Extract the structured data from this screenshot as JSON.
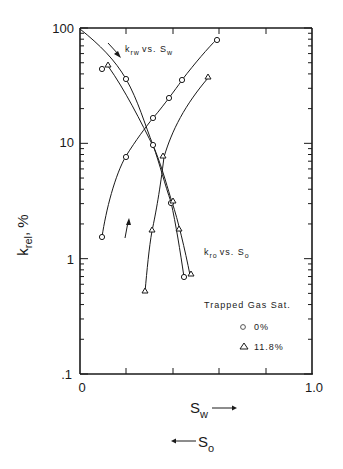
{
  "chart_data": {
    "type": "line",
    "title": "",
    "xlabel": "S_w (→), S_o (←)",
    "ylabel": "k_rel, %",
    "xlim": [
      0,
      1.0
    ],
    "ylim": [
      0.1,
      100
    ],
    "yscale": "log",
    "x_tick_labels": [
      "0",
      "1.0"
    ],
    "y_tick_labels": [
      "100",
      "10",
      "1",
      ".1"
    ],
    "grid": false,
    "annotations": [
      "k_rw vs. S_w",
      "k_ro vs. S_o"
    ],
    "legend": {
      "title": "Trapped Gas Sat.",
      "entries": [
        {
          "marker": "circle",
          "label": "0%"
        },
        {
          "marker": "triangle",
          "label": "11.8%"
        }
      ],
      "position": "lower right"
    },
    "series": [
      {
        "name": "k_rw, 0% trapped gas",
        "marker": "circle",
        "x": [
          0.09,
          0.2,
          0.32,
          0.39,
          0.44,
          0.59
        ],
        "y": [
          1.5,
          7.5,
          16,
          24,
          35,
          80
        ]
      },
      {
        "name": "k_rw, 11.8% trapped gas",
        "marker": "triangle",
        "x": [
          0.28,
          0.31,
          0.36,
          0.55
        ],
        "y": [
          0.5,
          1.7,
          7.5,
          36
        ]
      },
      {
        "name": "k_ro, 0% trapped gas",
        "marker": "circle",
        "x": [
          0.09,
          0.2,
          0.31,
          0.39,
          0.45
        ],
        "y": [
          45,
          35,
          9.5,
          3.0,
          0.7
        ]
      },
      {
        "name": "k_ro, 11.8% trapped gas",
        "marker": "triangle",
        "x": [
          0.11,
          0.39,
          0.42,
          0.48
        ],
        "y": [
          48,
          3.0,
          1.7,
          0.72
        ]
      }
    ]
  },
  "labels": {
    "y100": "100",
    "y10": "10",
    "y1": "1",
    "y01": ".1",
    "x0": "0",
    "x1": "1.0",
    "krw_k": "k",
    "krw_sub": "rw",
    "krw_vs": "vs. S",
    "krw_sub2": "w",
    "kro_k": "k",
    "kro_sub": "ro",
    "kro_vs": "vs. S",
    "kro_sub2": "o",
    "legend_title": "Trapped Gas Sat.",
    "legend_0": "0%",
    "legend_118": "11.8%",
    "ylabel_k": "k",
    "ylabel_sub": "rel",
    "ylabel_rest": ", %",
    "xlabel_sw": "S",
    "xlabel_sw_sub": "w",
    "xlabel_so": "S",
    "xlabel_so_sub": "o"
  }
}
